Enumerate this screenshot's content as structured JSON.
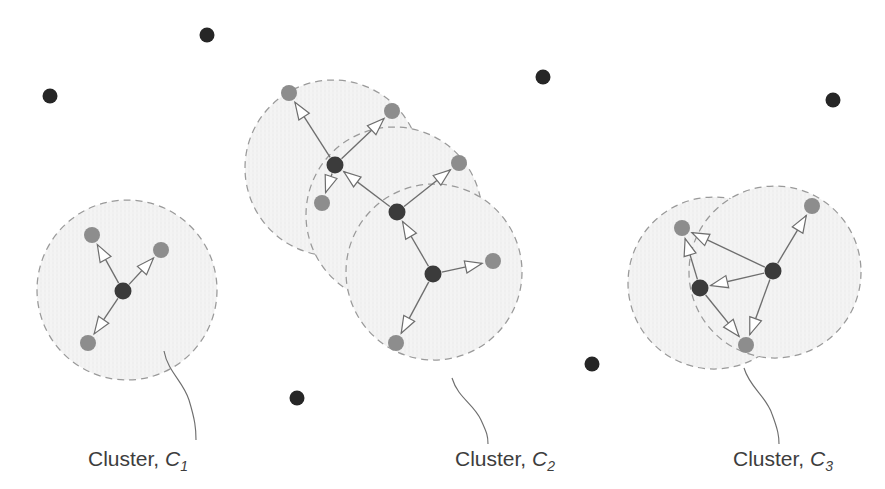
{
  "figure": {
    "width": 885,
    "height": 489,
    "background_color": "#ffffff"
  },
  "legend_semantics": {
    "core_point_color": "#3b3b3b",
    "border_point_color": "#8d8d8d",
    "noise_point_color": "#262626",
    "eps_circle_fill": "#f2f2f2",
    "eps_circle_stroke": "#9a9a9a",
    "arrow_stroke": "#6e6e6e",
    "arrow_fill": "#ffffff",
    "label_color": "#3d3d3d"
  },
  "clusters": [
    {
      "id": "c1",
      "label_text": "Cluster, ",
      "label_var": "C",
      "label_sub": "1",
      "label_x": 88,
      "label_y": 466,
      "leader": "M 164,351 C 168,372 183,381 189,400 C 195,420 196,428 196,440",
      "eps_circles": [
        {
          "cx": 127,
          "cy": 290,
          "r": 90
        }
      ],
      "core_points": [
        {
          "cx": 123,
          "cy": 291,
          "r": 8.5
        }
      ],
      "border_points": [
        {
          "cx": 92,
          "cy": 235,
          "r": 8
        },
        {
          "cx": 161,
          "cy": 250,
          "r": 8
        },
        {
          "cx": 88,
          "cy": 343,
          "r": 8
        }
      ],
      "edges": [
        {
          "x1": 123,
          "y1": 291,
          "x2": 92,
          "y2": 235
        },
        {
          "x1": 123,
          "y1": 291,
          "x2": 161,
          "y2": 250
        },
        {
          "x1": 123,
          "y1": 291,
          "x2": 88,
          "y2": 343
        }
      ]
    },
    {
      "id": "c2",
      "label_text": "Cluster, ",
      "label_var": "C",
      "label_sub": "2",
      "label_x": 455,
      "label_y": 466,
      "leader": "M 452,378 C 458,398 474,404 481,420 C 487,433 488,436 488,444",
      "eps_circles": [
        {
          "cx": 333,
          "cy": 168,
          "r": 88
        },
        {
          "cx": 394,
          "cy": 215,
          "r": 88
        },
        {
          "cx": 434,
          "cy": 272,
          "r": 88
        }
      ],
      "core_points": [
        {
          "cx": 335,
          "cy": 165,
          "r": 8.5
        },
        {
          "cx": 397,
          "cy": 212,
          "r": 8.5
        },
        {
          "cx": 433,
          "cy": 274,
          "r": 8.5
        }
      ],
      "border_points": [
        {
          "cx": 289,
          "cy": 93,
          "r": 8
        },
        {
          "cx": 392,
          "cy": 111,
          "r": 8
        },
        {
          "cx": 322,
          "cy": 203,
          "r": 8
        },
        {
          "cx": 459,
          "cy": 163,
          "r": 8
        },
        {
          "cx": 493,
          "cy": 261,
          "r": 8
        },
        {
          "cx": 396,
          "cy": 343,
          "r": 8
        }
      ],
      "edges": [
        {
          "x1": 335,
          "y1": 165,
          "x2": 289,
          "y2": 93
        },
        {
          "x1": 335,
          "y1": 165,
          "x2": 392,
          "y2": 111
        },
        {
          "x1": 335,
          "y1": 165,
          "x2": 322,
          "y2": 203
        },
        {
          "x1": 397,
          "y1": 212,
          "x2": 335,
          "y2": 165
        },
        {
          "x1": 397,
          "y1": 212,
          "x2": 459,
          "y2": 163
        },
        {
          "x1": 433,
          "y1": 274,
          "x2": 397,
          "y2": 212
        },
        {
          "x1": 433,
          "y1": 274,
          "x2": 493,
          "y2": 261
        },
        {
          "x1": 433,
          "y1": 274,
          "x2": 396,
          "y2": 343
        }
      ]
    },
    {
      "id": "c3",
      "label_text": "Cluster, ",
      "label_var": "C",
      "label_sub": "3",
      "label_x": 733,
      "label_y": 466,
      "leader": "M 744,368 C 750,388 766,396 772,414 C 778,430 779,436 779,444",
      "eps_circles": [
        {
          "cx": 714,
          "cy": 283,
          "r": 86
        },
        {
          "cx": 775,
          "cy": 272,
          "r": 86
        }
      ],
      "core_points": [
        {
          "cx": 700,
          "cy": 288,
          "r": 8.5
        },
        {
          "cx": 773,
          "cy": 271,
          "r": 8.5
        }
      ],
      "border_points": [
        {
          "cx": 682,
          "cy": 228,
          "r": 8
        },
        {
          "cx": 812,
          "cy": 206,
          "r": 8
        },
        {
          "cx": 746,
          "cy": 345,
          "r": 8
        }
      ],
      "edges": [
        {
          "x1": 700,
          "y1": 288,
          "x2": 682,
          "y2": 228
        },
        {
          "x1": 700,
          "y1": 288,
          "x2": 746,
          "y2": 345
        },
        {
          "x1": 773,
          "y1": 271,
          "x2": 682,
          "y2": 228
        },
        {
          "x1": 773,
          "y1": 271,
          "x2": 700,
          "y2": 288
        },
        {
          "x1": 773,
          "y1": 271,
          "x2": 812,
          "y2": 206
        },
        {
          "x1": 773,
          "y1": 271,
          "x2": 746,
          "y2": 345
        }
      ]
    }
  ],
  "noise_points": [
    {
      "cx": 207,
      "cy": 35,
      "r": 7.5
    },
    {
      "cx": 50,
      "cy": 96,
      "r": 7.5
    },
    {
      "cx": 543,
      "cy": 77,
      "r": 7.5
    },
    {
      "cx": 833,
      "cy": 100,
      "r": 7.5
    },
    {
      "cx": 297,
      "cy": 398,
      "r": 7.5
    },
    {
      "cx": 592,
      "cy": 364,
      "r": 7.5
    }
  ]
}
